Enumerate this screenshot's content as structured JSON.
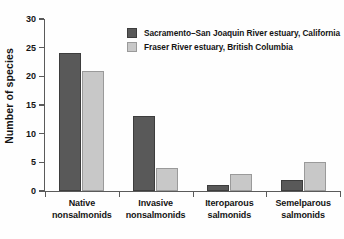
{
  "chart_data": {
    "type": "bar",
    "title": "",
    "xlabel": "",
    "ylabel": "Number of species",
    "ylim": [
      0,
      30
    ],
    "yticks": [
      0,
      5,
      10,
      15,
      20,
      25,
      30
    ],
    "grid": false,
    "legend_position": "top-center",
    "categories": [
      "Native nonsalmonids",
      "Invasive nonsalmonids",
      "Iteroparous salmonids",
      "Semelparous salmonids"
    ],
    "category_lines": [
      [
        "Native",
        "nonsalmonids"
      ],
      [
        "Invasive",
        "nonsalmonids"
      ],
      [
        "Iteroparous",
        "salmonids"
      ],
      [
        "Semelparous",
        "salmonids"
      ]
    ],
    "series": [
      {
        "name": "Sacramento–San Joaquin River estuary, California",
        "color": "#595959",
        "values": [
          24,
          13,
          1,
          2
        ]
      },
      {
        "name": "Fraser River estuary, British Columbia",
        "color": "#c8c8c8",
        "values": [
          21,
          4,
          3,
          5
        ]
      }
    ]
  },
  "axis": {
    "y_title": "Number of species",
    "y_tick_labels": [
      "0",
      "5",
      "10",
      "15",
      "20",
      "25",
      "30"
    ]
  },
  "legend": {
    "entries": [
      {
        "label": "Sacramento–San Joaquin River estuary, California",
        "swatch": "dark"
      },
      {
        "label": "Fraser River estuary, British Columbia",
        "swatch": "light"
      }
    ]
  },
  "colors": {
    "series_1": "#595959",
    "series_2": "#c8c8c8",
    "axis": "#5a5a5a",
    "text": "#141414",
    "background": "#fefefe"
  }
}
